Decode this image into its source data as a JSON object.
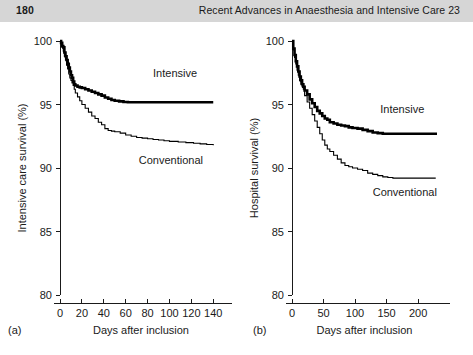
{
  "header": {
    "page_number": "180",
    "running_head": "Recent Advances in Anaesthesia and Intensive Care 23"
  },
  "colors": {
    "header_band": "#d6d6d6",
    "ink": "#1a1a1a",
    "curve": "#000000"
  },
  "chart_data": [
    {
      "id": "panel-a",
      "type": "line",
      "panel_letter": "(a)",
      "title": "",
      "xlabel": "Days after inclusion",
      "ylabel": "Intensive care survival (%)",
      "xlim": [
        0,
        148
      ],
      "ylim": [
        80,
        100
      ],
      "xticks": [
        0,
        20,
        40,
        60,
        80,
        100,
        120,
        140
      ],
      "xtick_labels": [
        "0",
        "20",
        "40",
        "60",
        "80",
        "100",
        "120",
        "140"
      ],
      "yticks": [
        80,
        85,
        90,
        95,
        100
      ],
      "ytick_labels": [
        "80",
        "85",
        "90",
        "95",
        "100"
      ],
      "grid": false,
      "legend_position": "inside-right",
      "series": [
        {
          "name": "Intensive",
          "label": "Intensive",
          "style": "thick",
          "label_x": 85,
          "label_y": 97.2,
          "points": [
            [
              0,
              100.0
            ],
            [
              1,
              99.85
            ],
            [
              2,
              99.6
            ],
            [
              3,
              99.5
            ],
            [
              4,
              99.1
            ],
            [
              5,
              98.8
            ],
            [
              6,
              98.5
            ],
            [
              7,
              98.2
            ],
            [
              8,
              97.9
            ],
            [
              9,
              97.6
            ],
            [
              10,
              97.3
            ],
            [
              11,
              97.1
            ],
            [
              12,
              96.8
            ],
            [
              13,
              96.6
            ],
            [
              14,
              96.5
            ],
            [
              16,
              96.4
            ],
            [
              18,
              96.35
            ],
            [
              20,
              96.3
            ],
            [
              23,
              96.2
            ],
            [
              26,
              96.1
            ],
            [
              29,
              96.0
            ],
            [
              32,
              95.9
            ],
            [
              35,
              95.8
            ],
            [
              38,
              95.7
            ],
            [
              41,
              95.55
            ],
            [
              44,
              95.45
            ],
            [
              47,
              95.35
            ],
            [
              50,
              95.3
            ],
            [
              54,
              95.25
            ],
            [
              58,
              95.2
            ],
            [
              62,
              95.18
            ],
            [
              140,
              95.18
            ]
          ]
        },
        {
          "name": "Conventional",
          "label": "Conventional",
          "style": "thin",
          "label_x": 72,
          "label_y": 90.3,
          "points": [
            [
              0,
              100.0
            ],
            [
              1,
              99.8
            ],
            [
              2,
              99.5
            ],
            [
              3,
              99.2
            ],
            [
              4,
              98.8
            ],
            [
              5,
              98.5
            ],
            [
              6,
              98.1
            ],
            [
              7,
              97.8
            ],
            [
              8,
              97.4
            ],
            [
              9,
              97.1
            ],
            [
              10,
              96.9
            ],
            [
              11,
              96.7
            ],
            [
              12,
              96.5
            ],
            [
              13,
              96.2
            ],
            [
              14,
              95.9
            ],
            [
              16,
              95.6
            ],
            [
              18,
              95.3
            ],
            [
              20,
              95.0
            ],
            [
              23,
              94.7
            ],
            [
              26,
              94.4
            ],
            [
              29,
              94.1
            ],
            [
              32,
              93.9
            ],
            [
              35,
              93.6
            ],
            [
              38,
              93.4
            ],
            [
              41,
              93.1
            ],
            [
              44,
              92.95
            ],
            [
              47,
              92.9
            ],
            [
              50,
              92.85
            ],
            [
              55,
              92.75
            ],
            [
              60,
              92.6
            ],
            [
              65,
              92.5
            ],
            [
              70,
              92.4
            ],
            [
              75,
              92.35
            ],
            [
              80,
              92.3
            ],
            [
              85,
              92.25
            ],
            [
              90,
              92.2
            ],
            [
              95,
              92.15
            ],
            [
              100,
              92.1
            ],
            [
              108,
              92.05
            ],
            [
              115,
              92.0
            ],
            [
              122,
              91.95
            ],
            [
              128,
              91.9
            ],
            [
              134,
              91.85
            ],
            [
              140,
              91.8
            ]
          ]
        }
      ]
    },
    {
      "id": "panel-b",
      "type": "line",
      "panel_letter": "(b)",
      "title": "",
      "xlabel": "Days after inclusion",
      "ylabel": "Hospital survival (%)",
      "xlim": [
        0,
        230
      ],
      "ylim": [
        80,
        100
      ],
      "xticks": [
        0,
        50,
        100,
        150,
        200
      ],
      "xtick_labels": [
        "0",
        "50",
        "100",
        "150",
        "200"
      ],
      "yticks": [
        80,
        85,
        90,
        95,
        100
      ],
      "ytick_labels": [
        "80",
        "85",
        "90",
        "95",
        "100"
      ],
      "grid": false,
      "legend_position": "inside-right",
      "series": [
        {
          "name": "Intensive",
          "label": "Intensive",
          "style": "thick",
          "label_x": 140,
          "label_y": 94.3,
          "points": [
            [
              0,
              100.0
            ],
            [
              2,
              99.4
            ],
            [
              4,
              98.9
            ],
            [
              6,
              98.4
            ],
            [
              8,
              98.0
            ],
            [
              10,
              97.6
            ],
            [
              12,
              97.2
            ],
            [
              14,
              96.9
            ],
            [
              16,
              96.6
            ],
            [
              18,
              96.4
            ],
            [
              20,
              96.1
            ],
            [
              24,
              95.8
            ],
            [
              28,
              95.4
            ],
            [
              32,
              95.1
            ],
            [
              36,
              94.8
            ],
            [
              40,
              94.5
            ],
            [
              44,
              94.3
            ],
            [
              48,
              94.1
            ],
            [
              52,
              93.9
            ],
            [
              56,
              93.8
            ],
            [
              60,
              93.6
            ],
            [
              66,
              93.5
            ],
            [
              72,
              93.4
            ],
            [
              78,
              93.35
            ],
            [
              84,
              93.3
            ],
            [
              90,
              93.2
            ],
            [
              96,
              93.15
            ],
            [
              104,
              93.1
            ],
            [
              112,
              93.0
            ],
            [
              120,
              92.9
            ],
            [
              128,
              92.8
            ],
            [
              136,
              92.75
            ],
            [
              144,
              92.7
            ],
            [
              230,
              92.7
            ]
          ]
        },
        {
          "name": "Conventional",
          "label": "Conventional",
          "style": "thin",
          "label_x": 128,
          "label_y": 87.8,
          "points": [
            [
              0,
              100.0
            ],
            [
              2,
              99.3
            ],
            [
              4,
              98.7
            ],
            [
              6,
              98.2
            ],
            [
              8,
              97.7
            ],
            [
              10,
              97.3
            ],
            [
              12,
              96.9
            ],
            [
              14,
              96.6
            ],
            [
              16,
              96.4
            ],
            [
              18,
              96.2
            ],
            [
              20,
              95.7
            ],
            [
              24,
              95.2
            ],
            [
              28,
              94.7
            ],
            [
              32,
              94.2
            ],
            [
              36,
              93.7
            ],
            [
              40,
              93.2
            ],
            [
              44,
              92.7
            ],
            [
              48,
              92.2
            ],
            [
              52,
              91.8
            ],
            [
              56,
              91.5
            ],
            [
              60,
              91.3
            ],
            [
              66,
              91.0
            ],
            [
              72,
              90.7
            ],
            [
              78,
              90.4
            ],
            [
              84,
              90.2
            ],
            [
              90,
              90.1
            ],
            [
              96,
              90.0
            ],
            [
              104,
              89.9
            ],
            [
              112,
              89.8
            ],
            [
              120,
              89.6
            ],
            [
              128,
              89.5
            ],
            [
              136,
              89.4
            ],
            [
              144,
              89.3
            ],
            [
              152,
              89.25
            ],
            [
              160,
              89.2
            ],
            [
              175,
              89.2
            ],
            [
              190,
              89.2
            ],
            [
              210,
              89.2
            ],
            [
              228,
              89.2
            ]
          ]
        }
      ]
    }
  ]
}
